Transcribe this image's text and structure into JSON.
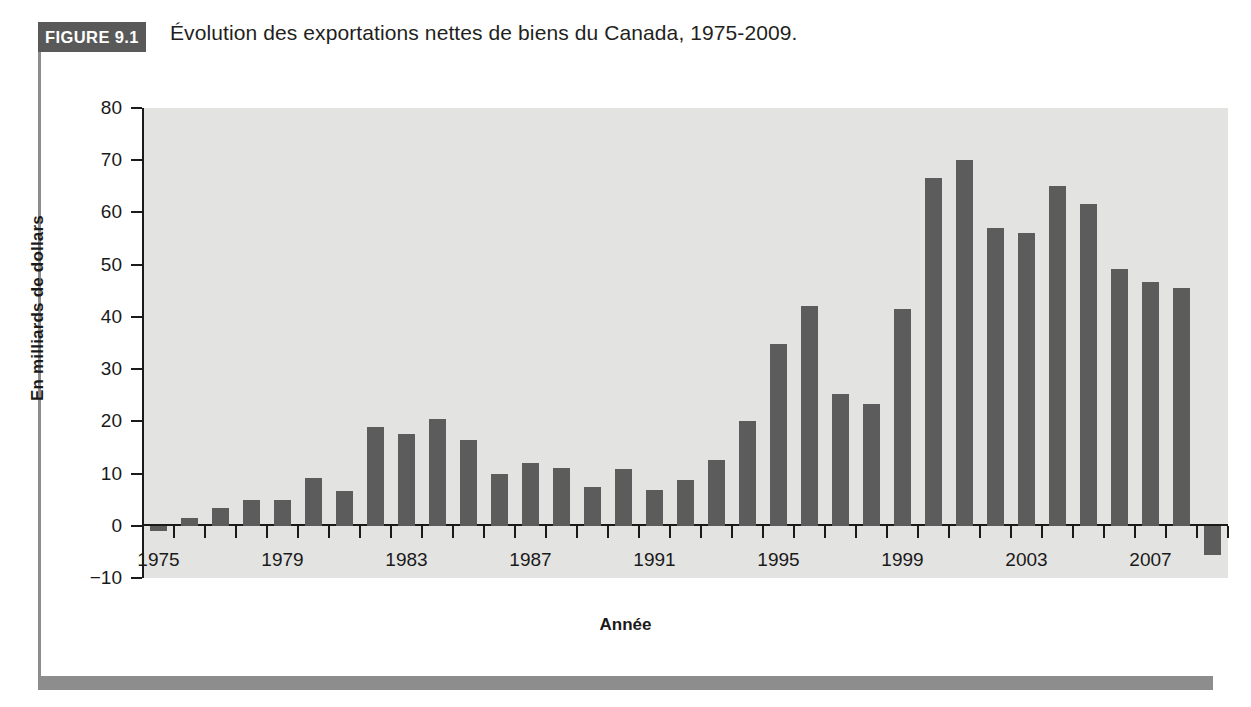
{
  "figure": {
    "badge": "FIGURE 9.1",
    "title": "Évolution des exportations nettes de biens du Canada, 1975-2009."
  },
  "colors": {
    "badge_bg": "#595959",
    "bar": "#5c5c5c",
    "plot_bg": "#e3e3e1",
    "rule": "#8d8d8d",
    "axis": "#1a1a1a"
  },
  "chart_data": {
    "type": "bar",
    "title": "Évolution des exportations nettes de biens du Canada, 1975-2009.",
    "xlabel": "Année",
    "ylabel": "En milliards de dollars",
    "ylim": [
      -10,
      80
    ],
    "yticks": [
      -10,
      0,
      10,
      20,
      30,
      40,
      50,
      60,
      70,
      80
    ],
    "ytick_labels": [
      "−10",
      "0",
      "10",
      "20",
      "30",
      "40",
      "50",
      "60",
      "70",
      "80"
    ],
    "xtick_labels": [
      "1975",
      "1979",
      "1983",
      "1987",
      "1991",
      "1995",
      "1999",
      "2003",
      "2007"
    ],
    "grid": false,
    "legend": null,
    "categories": [
      "1975",
      "1976",
      "1977",
      "1978",
      "1979",
      "1980",
      "1981",
      "1982",
      "1983",
      "1984",
      "1985",
      "1986",
      "1987",
      "1988",
      "1989",
      "1990",
      "1991",
      "1992",
      "1993",
      "1994",
      "1995",
      "1996",
      "1997",
      "1998",
      "1999",
      "2000",
      "2001",
      "2002",
      "2003",
      "2004",
      "2005",
      "2006",
      "2007",
      "2008",
      "2009"
    ],
    "values": [
      -1.0,
      1.5,
      3.5,
      5.0,
      5.0,
      9.1,
      6.7,
      18.9,
      17.5,
      20.4,
      16.4,
      10.0,
      12.0,
      11.0,
      7.5,
      10.8,
      6.9,
      8.8,
      12.6,
      20.1,
      34.8,
      42.0,
      25.2,
      23.3,
      41.5,
      66.6,
      70.0,
      57.0,
      56.1,
      65.0,
      61.6,
      49.2,
      46.6,
      45.5,
      -5.6
    ]
  }
}
